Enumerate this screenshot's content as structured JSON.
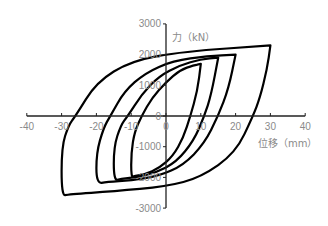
{
  "chart_data": {
    "type": "line",
    "title": "",
    "xlabel": "位移（mm）",
    "ylabel": "力（kN）",
    "xlim": [
      -40,
      40
    ],
    "ylim": [
      -3000,
      3000
    ],
    "xticks": [
      -40,
      -30,
      -20,
      -10,
      0,
      10,
      20,
      30,
      40
    ],
    "yticks": [
      -3000,
      -2000,
      -1000,
      0,
      1000,
      2000,
      3000
    ],
    "grid": false,
    "legend": null,
    "series": [
      {
        "name": "loop ±10mm",
        "amplitude_mm": 10,
        "peak_force_pos_kN": 1700,
        "peak_force_neg_kN": -2000,
        "x": [
          10,
          9,
          7,
          5,
          2,
          -2,
          -6,
          -9,
          -10,
          -10,
          -9,
          -7,
          -4,
          0,
          4,
          8,
          10
        ],
        "y": [
          1700,
          800,
          0,
          -700,
          -1300,
          -1700,
          -1900,
          -1950,
          -2000,
          -1200,
          -500,
          0,
          600,
          1100,
          1500,
          1650,
          1700
        ]
      },
      {
        "name": "loop ±15mm",
        "amplitude_mm": 15,
        "peak_force_pos_kN": 1900,
        "peak_force_neg_kN": -2100,
        "x": [
          15,
          13,
          11,
          8,
          3,
          -3,
          -9,
          -13,
          -15,
          -15,
          -13,
          -11,
          -7,
          -2,
          4,
          10,
          15
        ],
        "y": [
          1900,
          700,
          0,
          -800,
          -1500,
          -1850,
          -2000,
          -2050,
          -2100,
          -1000,
          -300,
          0,
          700,
          1300,
          1650,
          1850,
          1900
        ]
      },
      {
        "name": "loop ±20mm",
        "amplitude_mm": 20,
        "peak_force_pos_kN": 2000,
        "peak_force_neg_kN": -2200,
        "x": [
          20,
          18,
          15,
          11,
          5,
          -2,
          -10,
          -17,
          -20,
          -20,
          -18,
          -16,
          -12,
          -6,
          2,
          12,
          20
        ],
        "y": [
          2000,
          900,
          0,
          -900,
          -1600,
          -1950,
          -2100,
          -2150,
          -2200,
          -1200,
          -400,
          0,
          800,
          1400,
          1800,
          1950,
          2000
        ]
      },
      {
        "name": "loop ±30mm",
        "amplitude_mm": 30,
        "peak_force_pos_kN": 2300,
        "peak_force_neg_kN": -2600,
        "x": [
          30,
          29,
          27,
          25,
          20,
          10,
          0,
          -15,
          -28,
          -30,
          -30,
          -28,
          -26,
          -20,
          -10,
          5,
          30
        ],
        "y": [
          2300,
          1500,
          600,
          0,
          -1200,
          -2000,
          -2300,
          -2450,
          -2550,
          -2600,
          -1000,
          -300,
          0,
          1100,
          1800,
          2100,
          2300
        ]
      }
    ]
  },
  "axes": {
    "y_title": "力（kN）",
    "x_title": "位移（mm）",
    "x_tick_labels": [
      "-40",
      "-30",
      "-20",
      "-10",
      "0",
      "10",
      "20",
      "30",
      "40"
    ],
    "y_tick_labels": [
      "3000",
      "2000",
      "1000",
      "0",
      "-1000",
      "-2000",
      "-3000"
    ]
  },
  "colors": {
    "curve": "#000000",
    "axis": "#222222",
    "label": "#8a8a8a"
  }
}
